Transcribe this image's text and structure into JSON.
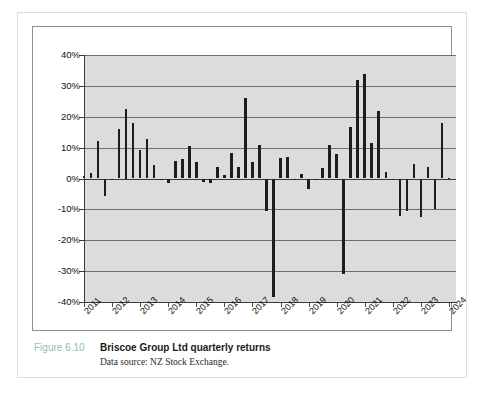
{
  "caption": {
    "figure_number": "Figure 6.10",
    "title": "Briscoe Group Ltd quarterly returns",
    "source": "Data source: NZ Stock Exchange."
  },
  "colors": {
    "bar": "#1d1d1d",
    "plot_background": "#dcdcdc",
    "gridline": "#6e6e6e",
    "axis": "#3b3b3b",
    "card_border": "#cfe4df",
    "figure_number": "#8fbdb4"
  },
  "chart_data": {
    "type": "bar",
    "title": "Briscoe Group Ltd quarterly returns",
    "xlabel": "",
    "ylabel": "",
    "ylim": [
      -40,
      40
    ],
    "ytick_labels": [
      "40%",
      "30%",
      "20%",
      "10%",
      "0%",
      "-10%",
      "-20%",
      "-30%",
      "-40%"
    ],
    "ytick_values": [
      40,
      30,
      20,
      10,
      0,
      -10,
      -20,
      -30,
      -40
    ],
    "grid": true,
    "legend": "none",
    "xtick_labels": [
      "2011",
      "2012",
      "2013",
      "2014",
      "2015",
      "2016",
      "2017",
      "2018",
      "2019",
      "2020",
      "2021",
      "2022",
      "2023",
      "2024"
    ],
    "xtick_values": [
      2011,
      2012,
      2013,
      2014,
      2015,
      2016,
      2017,
      2018,
      2019,
      2020,
      2021,
      2022,
      2023,
      2024
    ],
    "x_axis_range": [
      2011,
      2024.25
    ],
    "series_name": "Quarterly return",
    "categories": [
      "2011 Q1",
      "2011 Q2",
      "2011 Q3",
      "2011 Q4",
      "2012 Q1",
      "2012 Q2",
      "2012 Q3",
      "2012 Q4",
      "2013 Q1",
      "2013 Q2",
      "2013 Q3",
      "2013 Q4",
      "2014 Q1",
      "2014 Q2",
      "2014 Q3",
      "2014 Q4",
      "2015 Q1",
      "2015 Q2",
      "2015 Q3",
      "2015 Q4",
      "2016 Q1",
      "2016 Q2",
      "2016 Q3",
      "2016 Q4",
      "2017 Q1",
      "2017 Q2",
      "2017 Q3",
      "2017 Q4",
      "2018 Q1",
      "2018 Q2",
      "2018 Q3",
      "2018 Q4",
      "2019 Q1",
      "2019 Q2",
      "2019 Q3",
      "2019 Q4",
      "2020 Q1",
      "2020 Q2",
      "2020 Q3",
      "2020 Q4",
      "2021 Q1",
      "2021 Q2",
      "2021 Q3",
      "2021 Q4",
      "2022 Q1",
      "2022 Q2",
      "2022 Q3",
      "2022 Q4",
      "2023 Q1",
      "2023 Q2",
      "2023 Q3",
      "2023 Q4",
      "2024 Q1"
    ],
    "x": [
      2011.0,
      2011.25,
      2011.5,
      2011.75,
      2012.0,
      2012.25,
      2012.5,
      2012.75,
      2013.0,
      2013.25,
      2013.5,
      2013.75,
      2014.0,
      2014.25,
      2014.5,
      2014.75,
      2015.0,
      2015.25,
      2015.5,
      2015.75,
      2016.0,
      2016.25,
      2016.5,
      2016.75,
      2017.0,
      2017.25,
      2017.5,
      2017.75,
      2018.0,
      2018.25,
      2018.5,
      2018.75,
      2019.0,
      2019.25,
      2019.5,
      2019.75,
      2020.0,
      2020.25,
      2020.5,
      2020.75,
      2021.0,
      2021.25,
      2021.5,
      2021.75,
      2022.0,
      2022.25,
      2022.5,
      2022.75,
      2023.0,
      2023.25,
      2023.5,
      2023.75,
      2024.0
    ],
    "values": [
      0.8,
      1.8,
      12.2,
      -5.8,
      -0.6,
      15.9,
      22.5,
      17.9,
      9.3,
      12.7,
      4.5,
      -0.5,
      -1.3,
      5.8,
      6.4,
      10.5,
      5.3,
      -1.1,
      -1.4,
      3.6,
      1.2,
      8.2,
      3.8,
      26.2,
      5.4,
      10.9,
      -10.4,
      -38.4,
      6.7,
      7.1,
      -0.4,
      1.3,
      -3.5,
      -0.3,
      3.3,
      10.9,
      7.8,
      -31.0,
      16.6,
      31.9,
      34.0,
      11.5,
      21.8,
      2.2,
      -0.6,
      -12.2,
      -10.5,
      4.7,
      -12.6,
      3.6,
      -9.8,
      17.9,
      0.3
    ]
  }
}
